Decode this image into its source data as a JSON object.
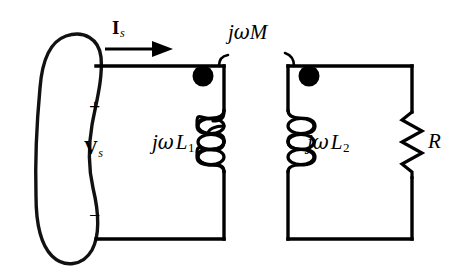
{
  "figure": {
    "type": "circuit-schematic",
    "width": 459,
    "height": 276,
    "background_color": "#ffffff",
    "line_color": "#000000"
  },
  "labels": {
    "source_current": "I",
    "source_current_sub": "s",
    "source_voltage": "V",
    "source_voltage_sub": "s",
    "polarity_plus": "+",
    "polarity_minus": "−",
    "mutual_inductance": "jωM",
    "mutual_j": "j",
    "mutual_omega": "ω",
    "mutual_m": "M",
    "primary_impedance_j": "j",
    "primary_impedance_omega": "ω",
    "primary_impedance_l": "L",
    "primary_impedance_sub": "1",
    "secondary_impedance_j": "j",
    "secondary_impedance_omega": "ω",
    "secondary_impedance_l": "L",
    "secondary_impedance_sub": "2",
    "resistor": "R"
  },
  "components": [
    {
      "name": "voltage-source",
      "symbol": "hand-drawn-oval",
      "label": "Vs",
      "terminals": [
        "+",
        "−"
      ]
    },
    {
      "name": "primary-inductor",
      "symbol": "coil-3-loop",
      "label": "jωL1",
      "dot_marked": true
    },
    {
      "name": "secondary-inductor",
      "symbol": "coil-3-loop",
      "label": "jωL2",
      "dot_marked": true
    },
    {
      "name": "load-resistor",
      "symbol": "zigzag",
      "label": "R"
    },
    {
      "name": "mutual-coupling",
      "symbol": "bracket-arcs",
      "label": "jωM"
    }
  ],
  "annotations": {
    "current_direction": "left-to-right",
    "dot_convention": "both-dots-at-top"
  }
}
